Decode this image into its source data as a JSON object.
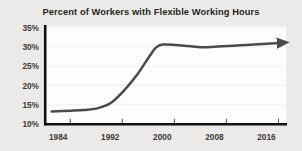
{
  "chart_data": {
    "type": "line",
    "title": "Percent of Workers with Flexible Working Hours",
    "xlabel": "",
    "ylabel": "",
    "xlim": [
      1982,
      2019
    ],
    "ylim": [
      10,
      35
    ],
    "grid": true,
    "legend": "none",
    "y_tick_labels": [
      "35%",
      "30%",
      "25%",
      "20%",
      "15%",
      "10%"
    ],
    "y_tick_values": [
      35,
      30,
      25,
      20,
      15,
      10
    ],
    "x_tick_labels": [
      "1984",
      "1992",
      "2000",
      "2008",
      "2016"
    ],
    "x_tick_values": [
      1984,
      1992,
      2000,
      2008,
      2016
    ],
    "series": [
      {
        "name": "Percent of workers with flexible working hours",
        "color": "#4a4a4a",
        "arrow_end": true,
        "x": [
          1983,
          1986,
          1988,
          1990,
          1992,
          1994,
          1996,
          1998,
          1999,
          2000,
          2002,
          2004,
          2006,
          2008,
          2010,
          2012,
          2014,
          2016,
          2018
        ],
        "values": [
          13.3,
          13.5,
          13.7,
          14.1,
          15.4,
          18.5,
          22.5,
          27.5,
          29.8,
          30.6,
          30.5,
          30.2,
          29.9,
          30.0,
          30.2,
          30.4,
          30.6,
          30.8,
          31.0
        ]
      }
    ],
    "colors": {
      "line": "#4a4a4a",
      "axis": "#111111",
      "grid": "#f0efed",
      "plot_background": "#fdfdfc",
      "page_background": "#eceae8",
      "title_text": "#262626",
      "tick_text": "#3a3a3a"
    }
  }
}
